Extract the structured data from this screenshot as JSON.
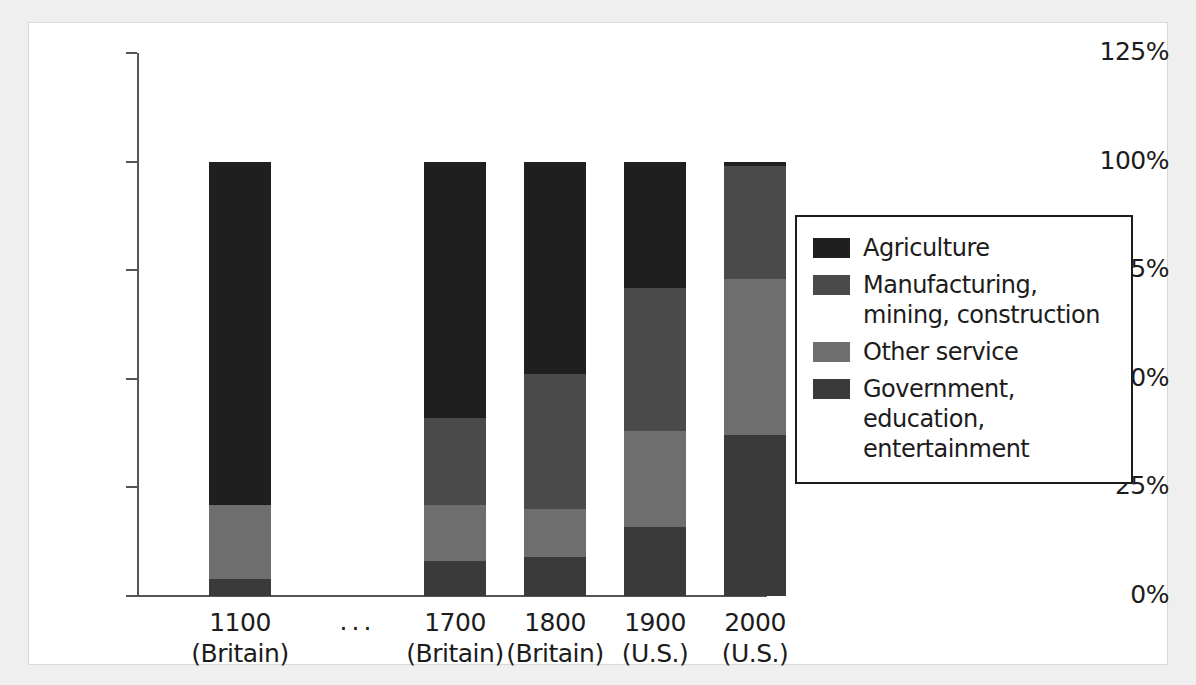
{
  "chart_data": {
    "type": "bar",
    "subtype": "stacked-bar-100-percent",
    "title": "",
    "xlabel": "",
    "ylabel": "",
    "ylim": [
      0,
      125
    ],
    "ytick_values": [
      0,
      25,
      50,
      75,
      100,
      125
    ],
    "ytick_labels": [
      "0%",
      "25%",
      "50%",
      "75%",
      "100%",
      "125%"
    ],
    "grid": false,
    "legend_position": "right",
    "categories": [
      {
        "year": "1100",
        "region": "(Britain)"
      },
      {
        "year": "1700",
        "region": "(Britain)"
      },
      {
        "year": "1800",
        "region": "(Britain)"
      },
      {
        "year": "1900",
        "region": "(U.S.)"
      },
      {
        "year": "2000",
        "region": "(U.S.)"
      }
    ],
    "gap_marker": "...",
    "series": [
      {
        "name": "Agriculture",
        "color": "#1f1f1f",
        "values": [
          79,
          59,
          49,
          29,
          1
        ]
      },
      {
        "name": "Manufacturing,\nmining, construction",
        "color": "#4a4a4a",
        "values": [
          0,
          20,
          31,
          33,
          26
        ]
      },
      {
        "name": "Other service",
        "color": "#6e6e6e",
        "values": [
          17,
          13,
          11,
          22,
          36
        ]
      },
      {
        "name": "Government, education,\nentertainment",
        "color": "#3a3a3a",
        "values": [
          4,
          8,
          9,
          16,
          37
        ]
      }
    ],
    "stack_boundaries_percent": {
      "1100": [
        0,
        4,
        21,
        21,
        100
      ],
      "1700": [
        0,
        8,
        21,
        41,
        100
      ],
      "1800": [
        0,
        9,
        20,
        51,
        100
      ],
      "1900": [
        0,
        16,
        38,
        71,
        100
      ],
      "2000": [
        0,
        37,
        73,
        99,
        100
      ]
    }
  },
  "legend": {
    "items": [
      {
        "label": "Agriculture",
        "color": "#1f1f1f"
      },
      {
        "label": "Manufacturing,\nmining, construction",
        "color": "#4a4a4a"
      },
      {
        "label": "Other service",
        "color": "#6e6e6e"
      },
      {
        "label": "Government, education,\nentertainment",
        "color": "#3a3a3a"
      }
    ]
  }
}
